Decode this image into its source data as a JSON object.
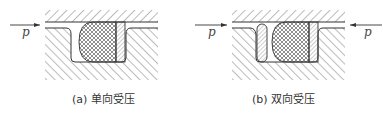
{
  "figures": [
    {
      "id": "a",
      "caption": "(a) 单向受压",
      "pressure_labels": [
        "p"
      ],
      "pressure_directions": [
        "left-to-right"
      ]
    },
    {
      "id": "b",
      "caption": "(b) 双向受压",
      "pressure_labels": [
        "p",
        "p"
      ],
      "pressure_directions": [
        "left-to-right",
        "right-to-left"
      ]
    }
  ],
  "colors": {
    "line": "#333333",
    "hatch": "#555555",
    "background": "#ffffff"
  }
}
